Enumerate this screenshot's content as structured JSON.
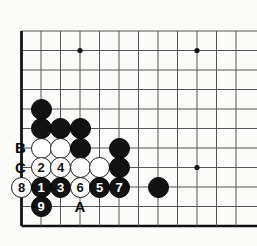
{
  "diagram": {
    "kind": "go-board-diagram",
    "board_size_visible": {
      "cols": 12,
      "rows": 11
    },
    "geometry": {
      "origin_x": 21.5,
      "origin_y": 31,
      "spacing": 19.5,
      "stone_radius": 10.5
    },
    "colors": {
      "black_stone": "#121212",
      "white_stone": "#ffffff",
      "stone_outline": "#161616",
      "grid_line": "#555555",
      "edge_line": "#111111",
      "background": "#fbfbf9",
      "label_text": "#0d0d0d"
    },
    "edges": {
      "left": true,
      "bottom": true
    },
    "star_points": [
      {
        "col": 3,
        "row": 1
      },
      {
        "col": 9,
        "row": 1
      },
      {
        "col": 9,
        "row": 7
      }
    ],
    "stones": [
      {
        "id": "b-41-109",
        "color": "black",
        "col": 1,
        "row": 4,
        "number": ""
      },
      {
        "id": "b-41-128",
        "color": "black",
        "col": 1,
        "row": 5,
        "number": ""
      },
      {
        "id": "b-60-128",
        "color": "black",
        "col": 2,
        "row": 5,
        "number": ""
      },
      {
        "id": "b-80-128",
        "color": "black",
        "col": 3,
        "row": 5,
        "number": ""
      },
      {
        "id": "w-41-148",
        "color": "white",
        "col": 1,
        "row": 6,
        "number": ""
      },
      {
        "id": "w-60-148",
        "color": "white",
        "col": 2,
        "row": 6,
        "number": ""
      },
      {
        "id": "b-80-148",
        "color": "black",
        "col": 3,
        "row": 6,
        "number": ""
      },
      {
        "id": "b-119-148",
        "color": "black",
        "col": 5,
        "row": 6,
        "number": ""
      },
      {
        "id": "w-41-167",
        "color": "white",
        "col": 1,
        "row": 7,
        "number": "2"
      },
      {
        "id": "w-60-167",
        "color": "white",
        "col": 2,
        "row": 7,
        "number": "4"
      },
      {
        "id": "w-80-167",
        "color": "white",
        "col": 3,
        "row": 7,
        "number": ""
      },
      {
        "id": "w-99-167",
        "color": "white",
        "col": 4,
        "row": 7,
        "number": ""
      },
      {
        "id": "b-119-167",
        "color": "black",
        "col": 5,
        "row": 7,
        "number": ""
      },
      {
        "id": "b-158-187",
        "color": "black",
        "col": 7,
        "row": 8,
        "number": ""
      },
      {
        "id": "w-21-187",
        "color": "white",
        "col": 0,
        "row": 8,
        "number": "8"
      },
      {
        "id": "b-41-187",
        "color": "black",
        "col": 1,
        "row": 8,
        "number": "1"
      },
      {
        "id": "b-60-187",
        "color": "black",
        "col": 2,
        "row": 8,
        "number": "3"
      },
      {
        "id": "w-80-187",
        "color": "white",
        "col": 3,
        "row": 8,
        "number": "6"
      },
      {
        "id": "b-99-187",
        "color": "black",
        "col": 4,
        "row": 8,
        "number": "5"
      },
      {
        "id": "b-119-187",
        "color": "black",
        "col": 5,
        "row": 8,
        "number": "7"
      },
      {
        "id": "b-41-207",
        "color": "black",
        "col": 1,
        "row": 9,
        "number": "9"
      }
    ],
    "point_labels": [
      {
        "id": "label-B",
        "text": "B",
        "col": -0.05,
        "row": 6
      },
      {
        "id": "label-C",
        "text": "C",
        "col": -0.05,
        "row": 7
      },
      {
        "id": "label-A",
        "text": "A",
        "col": 3,
        "row": 9
      }
    ]
  }
}
